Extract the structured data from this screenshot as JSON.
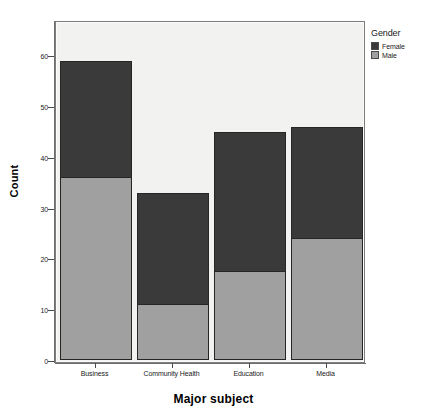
{
  "chart_data": {
    "type": "bar",
    "subtype": "stacked-vertical",
    "title": "",
    "xlabel": "Major subject",
    "ylabel": "Count",
    "categories": [
      "Business",
      "Community Health",
      "Education",
      "Media"
    ],
    "series": [
      {
        "name": "Male",
        "color": "#a0a0a0",
        "values": [
          36,
          11,
          17.5,
          24
        ]
      },
      {
        "name": "Female",
        "color": "#3a3a3a",
        "values": [
          23,
          22,
          27.5,
          22
        ]
      }
    ],
    "totals": [
      59,
      33,
      45,
      46
    ],
    "ylim": [
      0,
      67.3
    ],
    "yticks": [
      0,
      10,
      20,
      30,
      40,
      50,
      60
    ],
    "ytick_labels": [
      "0",
      "10",
      "20",
      "30",
      "40",
      "50",
      "60"
    ],
    "grid": false,
    "legend": {
      "title": "Gender",
      "position": "right-top",
      "entries": [
        {
          "label": "Female",
          "color": "#3a3a3a"
        },
        {
          "label": "Male",
          "color": "#a0a0a0"
        }
      ]
    },
    "stack_order": [
      "Male",
      "Female"
    ],
    "plot_background": "#f2f2f0",
    "figure_background": "#ffffff"
  },
  "axes": {
    "y": {
      "title": "Count",
      "ticks": [
        {
          "value": 0,
          "label": "0"
        },
        {
          "value": 10,
          "label": "10"
        },
        {
          "value": 20,
          "label": "20"
        },
        {
          "value": 30,
          "label": "30"
        },
        {
          "value": 40,
          "label": "40"
        },
        {
          "value": 50,
          "label": "50"
        },
        {
          "value": 60,
          "label": "60"
        }
      ]
    },
    "x": {
      "title": "Major subject",
      "ticks": [
        {
          "label": "Business"
        },
        {
          "label": "Community Health"
        },
        {
          "label": "Education"
        },
        {
          "label": "Media"
        }
      ]
    }
  },
  "legend": {
    "title": "Gender",
    "items": [
      {
        "label": "Female",
        "color": "#3a3a3a"
      },
      {
        "label": "Male",
        "color": "#a0a0a0"
      }
    ]
  },
  "bars": [
    {
      "category": "Business",
      "male": 36,
      "female": 23,
      "total": 59
    },
    {
      "category": "Community Health",
      "male": 11,
      "female": 22,
      "total": 33
    },
    {
      "category": "Education",
      "male": 17.5,
      "female": 27.5,
      "total": 45
    },
    {
      "category": "Media",
      "male": 24,
      "female": 22,
      "total": 46
    }
  ]
}
